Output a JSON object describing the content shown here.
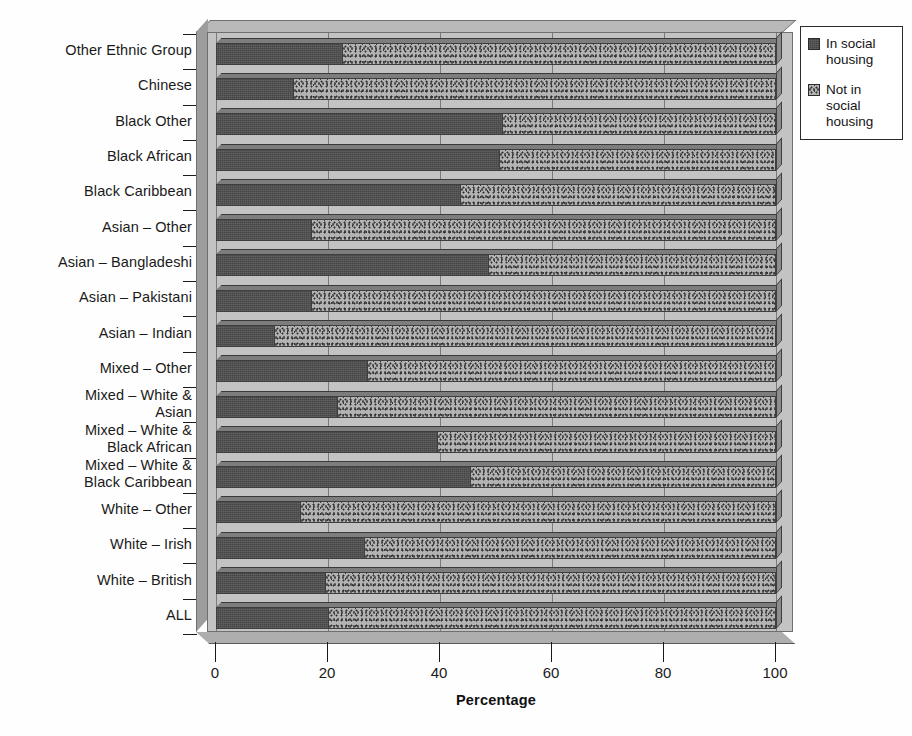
{
  "chart_data": {
    "type": "bar",
    "orientation": "horizontal",
    "stacked": true,
    "percent_stacked": true,
    "title": "",
    "xlabel": "Percentage",
    "ylabel": "",
    "xlim": [
      0,
      100
    ],
    "xticks": [
      0,
      20,
      40,
      60,
      80,
      100
    ],
    "grid": "vertical",
    "legend_position": "top-right",
    "categories": [
      "Other Ethnic Group",
      "Chinese",
      "Black Other",
      "Black African",
      "Black Caribbean",
      "Asian – Other",
      "Asian – Bangladeshi",
      "Asian – Pakistani",
      "Asian – Indian",
      "Mixed – Other",
      "Mixed – White & Asian",
      "Mixed – White & Black African",
      "Mixed – White & Black Caribbean",
      "White – Other",
      "White – Irish",
      "White – British",
      "ALL"
    ],
    "category_lines": [
      [
        "Other Ethnic Group"
      ],
      [
        "Chinese"
      ],
      [
        "Black Other"
      ],
      [
        "Black African"
      ],
      [
        "Black Caribbean"
      ],
      [
        "Asian – Other"
      ],
      [
        "Asian – Bangladeshi"
      ],
      [
        "Asian – Pakistani"
      ],
      [
        "Asian – Indian"
      ],
      [
        "Mixed – Other"
      ],
      [
        "Mixed – White &",
        "Asian"
      ],
      [
        "Mixed – White &",
        "Black African"
      ],
      [
        "Mixed – White &",
        "Black Caribbean"
      ],
      [
        "White – Other"
      ],
      [
        "White – Irish"
      ],
      [
        "White – British"
      ],
      [
        "ALL"
      ]
    ],
    "series": [
      {
        "name": "In social housing",
        "fill": "dark-solid",
        "color": "#4e4e4e",
        "values": [
          22.5,
          13.7,
          51.0,
          50.5,
          43.5,
          17.0,
          48.5,
          17.0,
          10.4,
          26.9,
          21.6,
          39.4,
          45.3,
          15.0,
          26.4,
          19.5,
          20.0
        ]
      },
      {
        "name": "Not in social housing",
        "fill": "stipple",
        "color": "#b3b3b3",
        "values": [
          77.5,
          86.3,
          49.0,
          49.5,
          56.5,
          83.0,
          51.5,
          83.0,
          89.6,
          73.1,
          78.4,
          60.6,
          54.7,
          85.0,
          73.6,
          80.5,
          80.0
        ]
      }
    ]
  },
  "axis": {
    "x_title": "Percentage",
    "x_tick_labels": [
      "0",
      "20",
      "40",
      "60",
      "80",
      "100"
    ]
  },
  "legend": {
    "items": [
      {
        "label_lines": [
          "In social",
          "housing"
        ],
        "swatch": "dark-solid"
      },
      {
        "label_lines": [
          "Not in",
          "social",
          "housing"
        ],
        "swatch": "stipple"
      }
    ]
  },
  "colors": {
    "bar_dark": "#4e4e4e",
    "bar_stipple_base": "#b3b3b3",
    "plot_wall": "#c3c3c3",
    "plot_top": "#b9b9b9",
    "plot_floor": "#aeaeae",
    "gridline": "#7a7a7a",
    "outline": "#3e3e3e",
    "text": "#1a1a1a"
  }
}
